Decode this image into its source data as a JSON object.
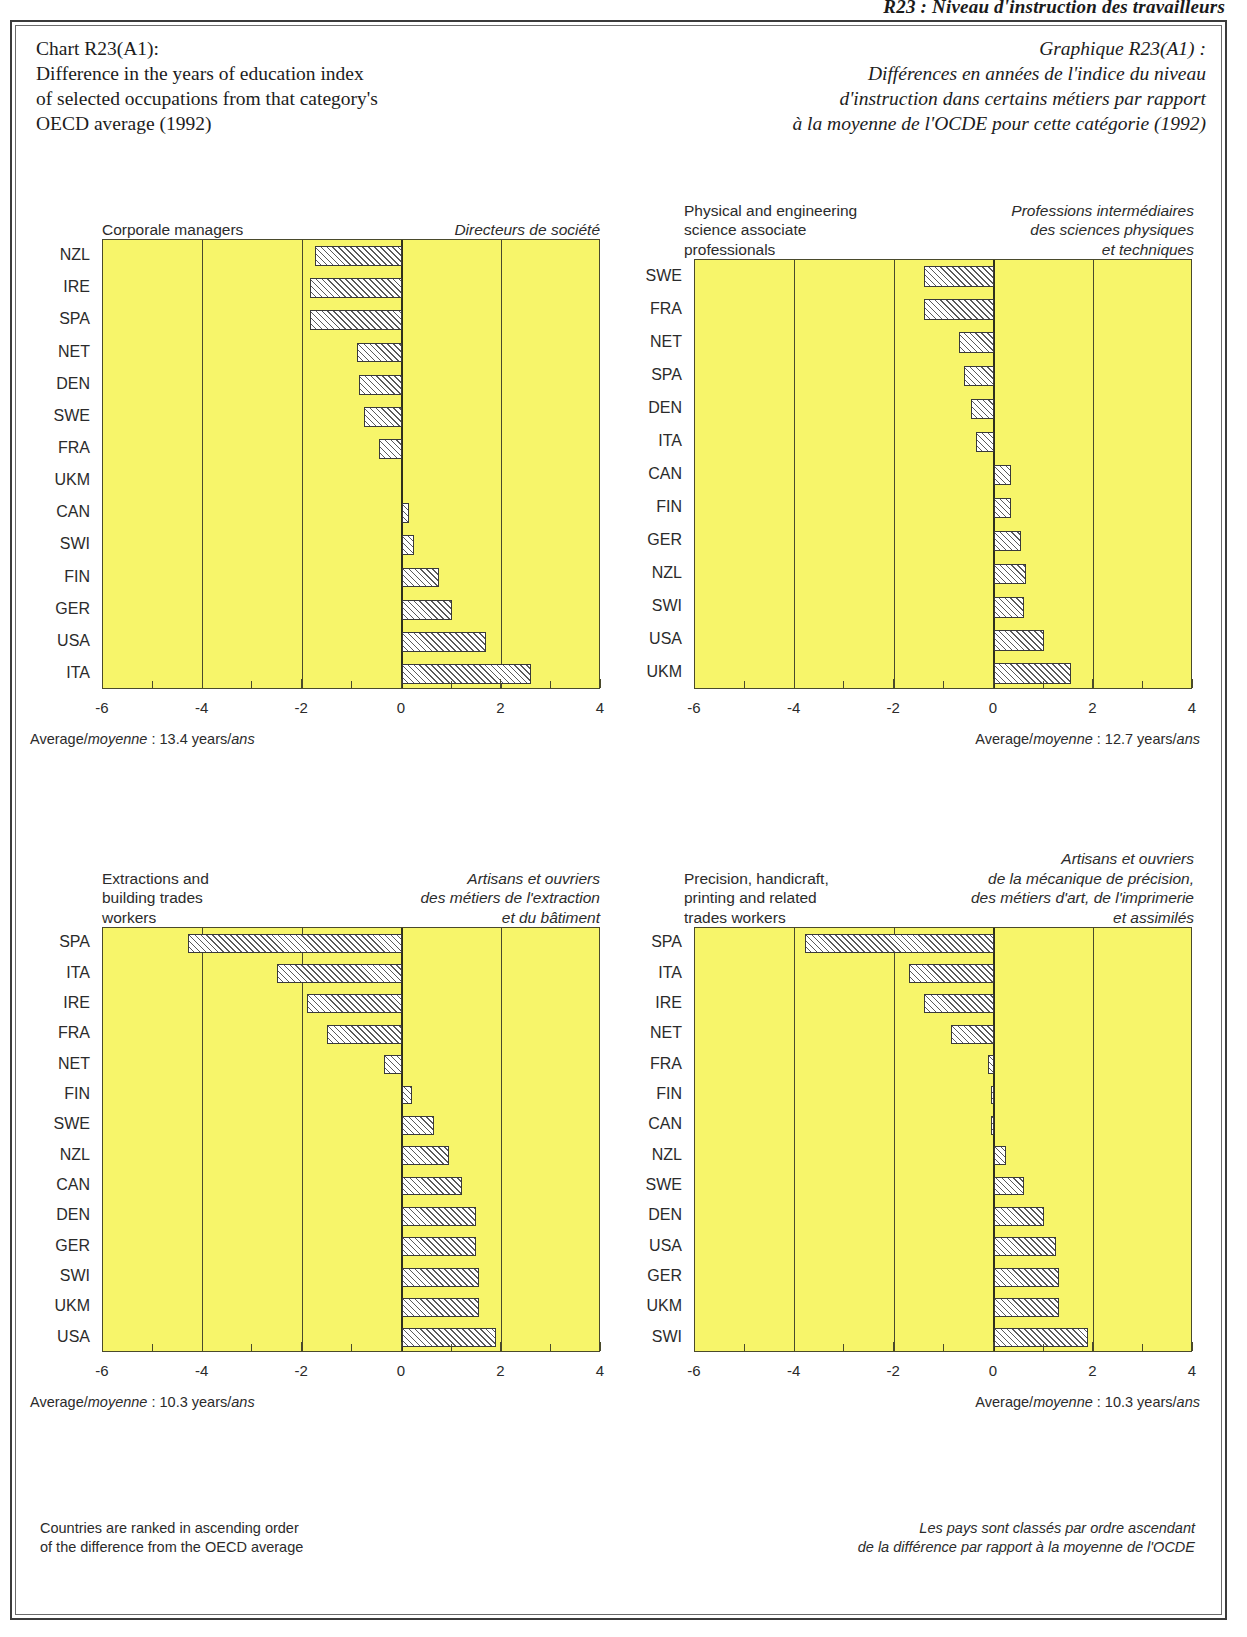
{
  "running_head": "R23 : Niveau d'instruction des travailleurs",
  "title": {
    "en_lines": [
      "Chart R23(A1):",
      "Difference in the years of education index",
      "of selected occupations from that category's",
      "OECD average (1992)"
    ],
    "fr_lines": [
      "Graphique R23(A1) :",
      "Différences en années de l'indice du niveau",
      "d'instruction dans certains métiers par rapport",
      "à la moyenne de l'OCDE pour cette catégorie (1992)"
    ]
  },
  "axis": {
    "ticks": [
      "-6",
      "-4",
      "-2",
      "0",
      "2",
      "4"
    ],
    "min": -6,
    "max": 4,
    "minor_step": 1
  },
  "footnotes": {
    "en_lines": [
      "Countries are ranked in ascending order",
      "of the difference from the OECD average"
    ],
    "fr_lines": [
      "Les pays sont classés par ordre ascendant",
      "de la différence par rapport à la moyenne de l'OCDE"
    ]
  },
  "colors": {
    "plot_fill": "#f7f56a",
    "plot_border": "#4a4a2c",
    "bar_hatch": "#5a5a5a",
    "bar_fill": "#ffffff",
    "text": "#2b2b2b"
  },
  "chart_data": [
    {
      "id": "corporate-managers",
      "type": "bar",
      "orientation": "horizontal",
      "title": "Corporale managers",
      "title_fr": "Directeurs de société",
      "xlabel": "",
      "ylabel": "",
      "xlim": [
        -6,
        4
      ],
      "xticks": [
        -6,
        -4,
        -2,
        0,
        2,
        4
      ],
      "grid": true,
      "legend": "none",
      "average_label": "Average/moyenne : 13.4 years/ans",
      "average_prefix": "Average/",
      "average_it1": "moyenne",
      "average_mid": " : 13.4 years/",
      "average_it2": "ans",
      "categories": [
        "NZL",
        "IRE",
        "SPA",
        "NET",
        "DEN",
        "SWE",
        "FRA",
        "UKM",
        "CAN",
        "SWI",
        "FIN",
        "GER",
        "USA",
        "ITA"
      ],
      "values": [
        -1.75,
        -1.85,
        -1.85,
        -0.9,
        -0.85,
        -0.75,
        -0.45,
        0.0,
        0.15,
        0.25,
        0.75,
        1.0,
        1.7,
        2.6
      ]
    },
    {
      "id": "physical-engineering-associates",
      "type": "bar",
      "orientation": "horizontal",
      "title_lines": [
        "Physical and engineering",
        "science associate",
        "professionals"
      ],
      "title_fr_lines": [
        "Professions intermédiaires",
        "des sciences physiques",
        "et techniques"
      ],
      "xlabel": "",
      "ylabel": "",
      "xlim": [
        -6,
        4
      ],
      "xticks": [
        -6,
        -4,
        -2,
        0,
        2,
        4
      ],
      "grid": true,
      "legend": "none",
      "average_label": "Average/moyenne : 12.7 years/ans",
      "average_prefix": "Average/",
      "average_it1": "moyenne",
      "average_mid": " : 12.7 years/",
      "average_it2": "ans",
      "categories": [
        "SWE",
        "FRA",
        "NET",
        "SPA",
        "DEN",
        "ITA",
        "CAN",
        "FIN",
        "GER",
        "NZL",
        "SWI",
        "USA",
        "UKM"
      ],
      "values": [
        -1.4,
        -1.4,
        -0.7,
        -0.6,
        -0.45,
        -0.35,
        0.35,
        0.35,
        0.55,
        0.65,
        0.6,
        1.0,
        1.55
      ]
    },
    {
      "id": "extraction-building-trades",
      "type": "bar",
      "orientation": "horizontal",
      "title_lines": [
        "Extractions and",
        "building trades",
        "workers"
      ],
      "title_fr_lines": [
        "Artisans et ouvriers",
        "des métiers de l'extraction",
        "et du bâtiment"
      ],
      "xlabel": "",
      "ylabel": "",
      "xlim": [
        -6,
        4
      ],
      "xticks": [
        -6,
        -4,
        -2,
        0,
        2,
        4
      ],
      "grid": true,
      "legend": "none",
      "average_label": "Average/moyenne : 10.3 years/ans",
      "average_prefix": "Average/",
      "average_it1": "moyenne",
      "average_mid": " : 10.3 years/",
      "average_it2": "ans",
      "categories": [
        "SPA",
        "ITA",
        "IRE",
        "FRA",
        "NET",
        "FIN",
        "SWE",
        "NZL",
        "CAN",
        "DEN",
        "GER",
        "SWI",
        "UKM",
        "USA"
      ],
      "values": [
        -4.3,
        -2.5,
        -1.9,
        -1.5,
        -0.35,
        0.2,
        0.65,
        0.95,
        1.2,
        1.5,
        1.5,
        1.55,
        1.55,
        1.9
      ]
    },
    {
      "id": "precision-handicraft-printing",
      "type": "bar",
      "orientation": "horizontal",
      "title_lines": [
        "Precision, handicraft,",
        "printing and related",
        "trades workers"
      ],
      "title_fr_lines": [
        "Artisans et ouvriers",
        "de la mécanique de précision,",
        "des métiers d'art, de l'imprimerie",
        "et assimilés"
      ],
      "xlabel": "",
      "ylabel": "",
      "xlim": [
        -6,
        4
      ],
      "xticks": [
        -6,
        -4,
        -2,
        0,
        2,
        4
      ],
      "grid": true,
      "legend": "none",
      "average_label": "Average/moyenne : 10.3 years/ans",
      "average_prefix": "Average/",
      "average_it1": "moyenne",
      "average_mid": " : 10.3 years/",
      "average_it2": "ans",
      "categories": [
        "SPA",
        "ITA",
        "IRE",
        "NET",
        "FRA",
        "FIN",
        "CAN",
        "NZL",
        "SWE",
        "DEN",
        "USA",
        "GER",
        "UKM",
        "SWI"
      ],
      "values": [
        -3.8,
        -1.7,
        -1.4,
        -0.85,
        -0.12,
        -0.06,
        -0.05,
        0.25,
        0.6,
        1.0,
        1.25,
        1.3,
        1.3,
        1.9
      ]
    }
  ]
}
